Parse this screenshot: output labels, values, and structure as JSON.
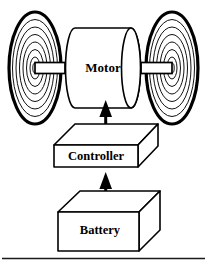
{
  "figure": {
    "canvas": {
      "width": 207,
      "height": 264,
      "background": "#ffffff"
    },
    "ink_color": "#000000",
    "blocks": [
      {
        "id": "motor",
        "label": "Motor",
        "shape": "cylinder",
        "label_x": 103,
        "label_y": 68
      },
      {
        "id": "controller",
        "label": "Controller",
        "shape": "3d-slab",
        "label_x": 96,
        "label_y": 156
      },
      {
        "id": "battery",
        "label": "Battery",
        "shape": "3d-box",
        "label_x": 100,
        "label_y": 228
      }
    ],
    "wheels": [
      {
        "id": "wheel-left",
        "cx": 35,
        "cy": 68,
        "rx": 27,
        "ry": 57,
        "rings": 7
      },
      {
        "id": "wheel-right",
        "cx": 172,
        "cy": 68,
        "rx": 27,
        "ry": 57,
        "rings": 7
      }
    ],
    "axles": [
      {
        "id": "axle-left",
        "from": "wheel-left",
        "to": "motor"
      },
      {
        "id": "axle-right",
        "from": "motor",
        "to": "wheel-right"
      }
    ],
    "arrows": [
      {
        "id": "arrow-controller-to-motor",
        "from": "controller",
        "to": "motor",
        "direction": "up"
      },
      {
        "id": "arrow-battery-to-controller",
        "from": "battery",
        "to": "controller",
        "direction": "up"
      }
    ],
    "rules": [
      {
        "id": "bottom-rule",
        "y": 258,
        "x1": 2,
        "x2": 205
      }
    ]
  }
}
